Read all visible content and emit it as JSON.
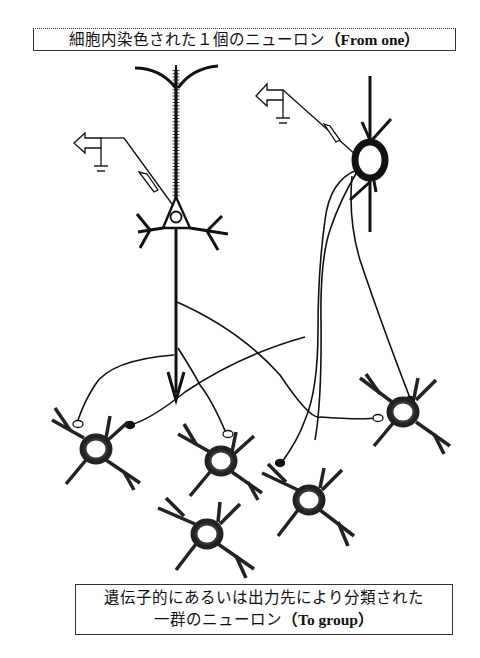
{
  "labels": {
    "top": {
      "jp": "細胞内染色された１個のニューロン",
      "en": "（From one）"
    },
    "bottom": {
      "line1": "遺伝子的にあるいは出力先により分類された",
      "line2_jp": "一群のニューロン",
      "line2_en": "（To group）"
    }
  },
  "diagram": {
    "source_neurons": [
      {
        "id": "pyramidal",
        "type": "pyramidal-cell",
        "recorded": true
      },
      {
        "id": "round",
        "type": "multipolar-cell",
        "recorded": true
      }
    ],
    "target_neurons_count": 5,
    "synapse_types": [
      "open-terminal",
      "filled-terminal"
    ],
    "electrodes": 2,
    "colors": {
      "ink": "#111111",
      "soma_shade": "#3a3a3a",
      "background": "#ffffff"
    }
  }
}
